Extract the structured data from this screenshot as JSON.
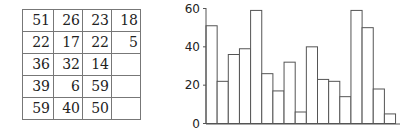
{
  "table": {
    "rows": [
      [
        "51",
        "26",
        "23",
        "18"
      ],
      [
        "22",
        "17",
        "22",
        "5"
      ],
      [
        "36",
        "32",
        "14",
        ""
      ],
      [
        "39",
        "6",
        "59",
        ""
      ],
      [
        "59",
        "40",
        "50",
        ""
      ]
    ]
  },
  "chart_data": {
    "type": "bar",
    "title": "",
    "xlabel": "",
    "ylabel": "",
    "categories": [
      "1",
      "2",
      "3",
      "4",
      "5",
      "6",
      "7",
      "8",
      "9",
      "10",
      "11",
      "12",
      "13",
      "14",
      "15",
      "16",
      "17"
    ],
    "values": [
      51,
      22,
      36,
      39,
      59,
      26,
      17,
      32,
      6,
      40,
      23,
      22,
      14,
      59,
      50,
      18,
      5
    ],
    "ylim": [
      0,
      60
    ],
    "yticks": [
      "0",
      "20",
      "40",
      "60"
    ],
    "grid": false,
    "legend": null,
    "bar_fill": "#ffffff",
    "bar_stroke": "#555555"
  }
}
